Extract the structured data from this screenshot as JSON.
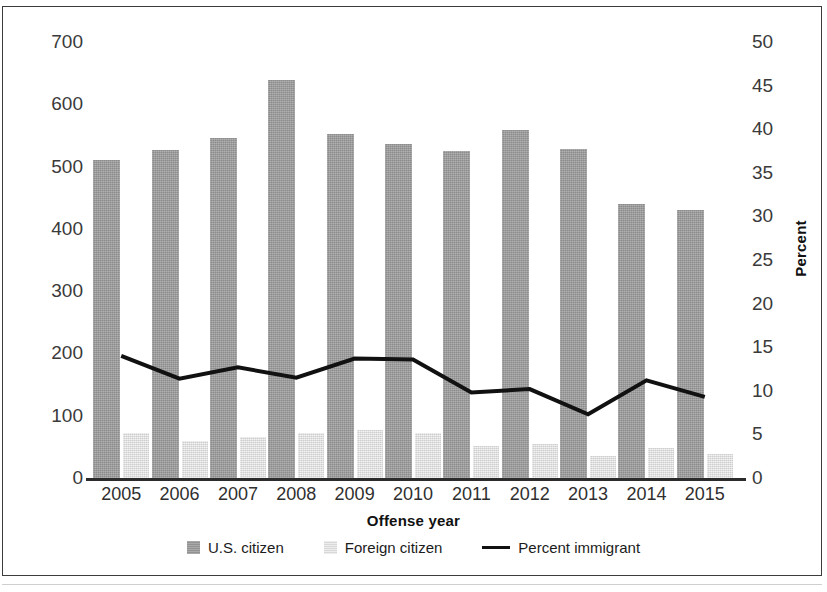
{
  "chart_data": {
    "type": "bar",
    "title": "",
    "xlabel": "Offense year",
    "ylabel": "Frequency",
    "ylabel_right": "Percent",
    "categories": [
      "2005",
      "2006",
      "2007",
      "2008",
      "2009",
      "2010",
      "2011",
      "2012",
      "2013",
      "2014",
      "2015"
    ],
    "ylim": [
      0,
      700
    ],
    "yticks": [
      0,
      100,
      200,
      300,
      400,
      500,
      600,
      700
    ],
    "ylim_right": [
      0,
      50
    ],
    "yticks_right": [
      0,
      5,
      10,
      15,
      20,
      25,
      30,
      35,
      40,
      45,
      50
    ],
    "grid": false,
    "legend_position": "bottom-center",
    "series": [
      {
        "name": "U.S. citizen",
        "type": "bar",
        "axis": "left",
        "color": "#9d9d9d",
        "values": [
          511,
          527,
          546,
          639,
          552,
          537,
          525,
          558,
          529,
          440,
          431
        ]
      },
      {
        "name": "Foreign citizen",
        "type": "bar",
        "axis": "left",
        "color": "#e2e2e2",
        "values": [
          72,
          59,
          66,
          73,
          77,
          72,
          51,
          55,
          35,
          48,
          38
        ]
      },
      {
        "name": "Percent immigrant",
        "type": "line",
        "axis": "right",
        "color": "#111111",
        "values": [
          14.0,
          11.4,
          12.7,
          11.5,
          13.7,
          13.6,
          9.8,
          10.2,
          7.3,
          11.2,
          9.3
        ]
      }
    ]
  },
  "axes": {
    "left_title": "Frequency",
    "right_title": "Percent",
    "x_title": "Offense year",
    "left_ticks": [
      "700",
      "600",
      "500",
      "400",
      "300",
      "200",
      "100",
      "0"
    ],
    "right_ticks": [
      "50",
      "45",
      "40",
      "35",
      "30",
      "25",
      "20",
      "15",
      "10",
      "5",
      "0"
    ],
    "x_ticks": [
      "2005",
      "2006",
      "2007",
      "2008",
      "2009",
      "2010",
      "2011",
      "2012",
      "2013",
      "2014",
      "2015"
    ]
  },
  "legend": {
    "items": [
      {
        "label": "U.S. citizen",
        "marker": "bar-swatch-dark"
      },
      {
        "label": "Foreign citizen",
        "marker": "bar-swatch-light"
      },
      {
        "label": "Percent immigrant",
        "marker": "line-swatch-black"
      }
    ]
  }
}
